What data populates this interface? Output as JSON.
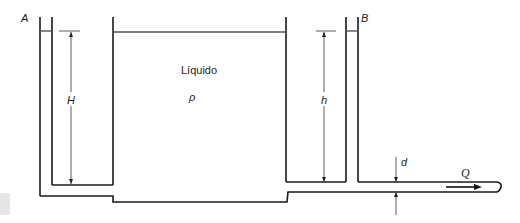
{
  "diagram": {
    "labels": {
      "tube_a": "A",
      "tube_b": "B",
      "liquid": "Líquido",
      "density": "ρ",
      "height_a": "H",
      "height_b": "h",
      "diameter": "d",
      "flow": "Q"
    },
    "colors": {
      "stroke": "#1a1a1a",
      "level": "#555555",
      "background": "#ffffff"
    }
  }
}
